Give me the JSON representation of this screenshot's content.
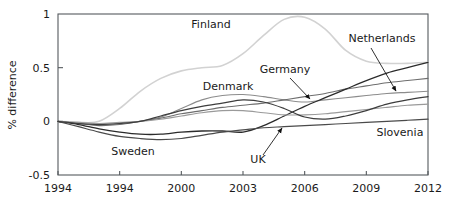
{
  "chart_data": {
    "type": "line",
    "title": "",
    "xlabel": "",
    "ylabel": "% difference",
    "xlim": [
      1994,
      2012
    ],
    "ylim": [
      -0.5,
      1.0
    ],
    "grid": false,
    "legend_position": "inline-annotations",
    "xticks": [
      1994,
      1994,
      2000,
      2003,
      2006,
      2009,
      2012
    ],
    "xtick_labels": [
      "1994",
      "1994",
      "2000",
      "2003",
      "2006",
      "2009",
      "2012"
    ],
    "yticks": [
      -0.5,
      0,
      0.5,
      1
    ],
    "ytick_labels": [
      "-0.5",
      "0",
      "0.5",
      "1"
    ],
    "x": [
      1994,
      1995,
      1996,
      1997,
      1998,
      1999,
      2000,
      2001,
      2002,
      2003,
      2004,
      2005,
      2006,
      2007,
      2008,
      2009,
      2010,
      2011,
      2012
    ],
    "series": [
      {
        "name": "Finland",
        "color": "#d2d2d2",
        "width": 1.6,
        "values": [
          0.0,
          -0.01,
          0.0,
          0.12,
          0.28,
          0.4,
          0.47,
          0.5,
          0.52,
          0.63,
          0.8,
          0.95,
          0.97,
          0.86,
          0.66,
          0.56,
          0.54,
          0.54,
          0.55
        ]
      },
      {
        "name": "Denmark",
        "color": "#8c8c8c",
        "width": 1.1,
        "values": [
          0.0,
          -0.02,
          -0.03,
          -0.02,
          0.0,
          0.04,
          0.12,
          0.2,
          0.24,
          0.25,
          0.23,
          0.2,
          0.18,
          0.2,
          0.22,
          0.24,
          0.26,
          0.27,
          0.28
        ]
      },
      {
        "name": "Germany",
        "color": "#6e6e6e",
        "width": 1.1,
        "values": [
          0.0,
          -0.02,
          -0.04,
          -0.03,
          0.0,
          0.03,
          0.07,
          0.1,
          0.13,
          0.15,
          0.17,
          0.2,
          0.23,
          0.26,
          0.3,
          0.33,
          0.36,
          0.38,
          0.4
        ]
      },
      {
        "name": "Netherlands",
        "color": "#2b2b2b",
        "width": 1.3,
        "values": [
          0.0,
          -0.03,
          -0.07,
          -0.1,
          -0.12,
          -0.12,
          -0.1,
          -0.09,
          -0.09,
          -0.1,
          -0.04,
          0.05,
          0.14,
          0.22,
          0.3,
          0.38,
          0.45,
          0.5,
          0.55
        ]
      },
      {
        "name": "Slovenia",
        "color": "#9a9a9a",
        "width": 1.1,
        "values": [
          0.0,
          -0.01,
          -0.02,
          -0.01,
          0.0,
          0.02,
          0.05,
          0.08,
          0.1,
          0.1,
          0.08,
          0.06,
          0.06,
          0.07,
          0.09,
          0.11,
          0.13,
          0.15,
          0.16
        ]
      },
      {
        "name": "Sweden",
        "color": "#4a4a4a",
        "width": 1.2,
        "values": [
          0.0,
          -0.05,
          -0.1,
          -0.14,
          -0.16,
          -0.17,
          -0.16,
          -0.13,
          -0.1,
          -0.08,
          -0.06,
          -0.05,
          -0.04,
          -0.03,
          -0.02,
          -0.01,
          0.0,
          0.01,
          0.02
        ]
      },
      {
        "name": "UK",
        "color": "#3d3d3d",
        "width": 1.2,
        "values": [
          0.0,
          -0.02,
          -0.03,
          -0.02,
          0.0,
          0.05,
          0.1,
          0.14,
          0.17,
          0.2,
          0.18,
          0.12,
          0.04,
          0.02,
          0.05,
          0.1,
          0.16,
          0.2,
          0.23
        ]
      }
    ],
    "annotations": [
      {
        "name": "Finland",
        "label": "Finland",
        "x": 211,
        "y": 28,
        "anchor": "middle",
        "leader": null
      },
      {
        "name": "Netherlands",
        "label": "Netherlands",
        "x": 382,
        "y": 42,
        "anchor": "middle",
        "leader": {
          "x1": 371,
          "y1": 48,
          "x2": 396,
          "y2": 91,
          "arrow": true
        }
      },
      {
        "name": "Germany",
        "label": "Germany",
        "x": 285,
        "y": 73,
        "anchor": "middle",
        "leader": {
          "x1": 290,
          "y1": 78,
          "x2": 310,
          "y2": 99,
          "arrow": true
        }
      },
      {
        "name": "Denmark",
        "label": "Denmark",
        "x": 228,
        "y": 90,
        "anchor": "middle",
        "leader": null
      },
      {
        "name": "Slovenia",
        "label": "Slovenia",
        "x": 400,
        "y": 136,
        "anchor": "middle",
        "leader": null
      },
      {
        "name": "Sweden",
        "label": "Sweden",
        "x": 133,
        "y": 155,
        "anchor": "middle",
        "leader": null
      },
      {
        "name": "UK",
        "label": "UK",
        "x": 258,
        "y": 163,
        "anchor": "middle",
        "leader": {
          "x1": 263,
          "y1": 155,
          "x2": 282,
          "y2": 128,
          "arrow": true
        }
      }
    ]
  },
  "plot_geometry": {
    "left": 58,
    "right": 428,
    "top": 14,
    "bottom": 175
  }
}
